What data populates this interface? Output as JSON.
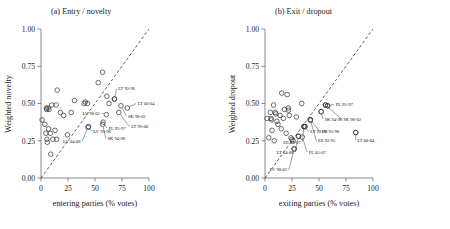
{
  "figure": {
    "width": 450,
    "height": 229,
    "background": "#ffffff",
    "marker_color": "#3c3c3c",
    "line_color": "#2b2b2b"
  },
  "chart_data": [
    {
      "type": "scatter",
      "panel": "a",
      "title": "(a) Entry / novelty",
      "xlabel": "entering parties (% votes)",
      "ylabel": "Weighted novelty",
      "xlim": [
        0,
        100
      ],
      "ylim": [
        0,
        1
      ],
      "xticks": [
        0,
        25,
        50,
        75,
        100
      ],
      "xtick_labels": [
        "0",
        "25",
        "50",
        "75",
        "100"
      ],
      "yticks": [
        0,
        0.25,
        0.5,
        0.75,
        1
      ],
      "ytick_labels": [
        "0.00",
        "0.25",
        "0.50",
        "0.75",
        "1.00"
      ],
      "grid": false,
      "legend": "none",
      "reference_line": {
        "type": "diagonal",
        "style": "dashed",
        "from": [
          0,
          0
        ],
        "to": [
          100,
          1
        ]
      },
      "points": [
        {
          "x": 1.0,
          "y": 0.39
        },
        {
          "x": 3.5,
          "y": 0.36
        },
        {
          "x": 4.5,
          "y": 0.3
        },
        {
          "x": 5.0,
          "y": 0.47
        },
        {
          "x": 5.2,
          "y": 0.46
        },
        {
          "x": 5.5,
          "y": 0.26
        },
        {
          "x": 5.8,
          "y": 0.24
        },
        {
          "x": 6.5,
          "y": 0.47
        },
        {
          "x": 7.0,
          "y": 0.33
        },
        {
          "x": 7.5,
          "y": 0.46
        },
        {
          "x": 8.5,
          "y": 0.3
        },
        {
          "x": 9.0,
          "y": 0.16
        },
        {
          "x": 10.0,
          "y": 0.49
        },
        {
          "x": 11.0,
          "y": 0.26
        },
        {
          "x": 13.0,
          "y": 0.32
        },
        {
          "x": 14.0,
          "y": 0.49
        },
        {
          "x": 14.5,
          "y": 0.26
        },
        {
          "x": 15.0,
          "y": 0.59
        },
        {
          "x": 18.0,
          "y": 0.44
        },
        {
          "x": 21.0,
          "y": 0.42
        },
        {
          "x": 24.5,
          "y": 0.29
        },
        {
          "x": 28.0,
          "y": 0.44
        },
        {
          "x": 31.0,
          "y": 0.52
        },
        {
          "x": 40.0,
          "y": 0.5
        },
        {
          "x": 41.0,
          "y": 0.51
        },
        {
          "x": 43.0,
          "y": 0.5
        },
        {
          "x": 53.0,
          "y": 0.64
        },
        {
          "x": 57.0,
          "y": 0.71
        },
        {
          "x": 61.0,
          "y": 0.55
        },
        {
          "x": 63.0,
          "y": 0.5
        },
        {
          "x": 68.0,
          "y": 0.53
        }
      ],
      "labeled_points": [
        {
          "label": "LT 92-96",
          "x": 68.0,
          "y": 0.53,
          "lx": 70.0,
          "ly": 0.6
        },
        {
          "label": "LT 00-04",
          "x": 80.0,
          "y": 0.47,
          "lx": 88.0,
          "ly": 0.5
        },
        {
          "label": "SK 98-02",
          "x": 74.0,
          "y": 0.485,
          "lx": 79.0,
          "ly": 0.415
        },
        {
          "label": "LV 98-02",
          "x": 60.5,
          "y": 0.425,
          "lx": 56.0,
          "ly": 0.435
        },
        {
          "label": "LT 96-00",
          "x": 72.0,
          "y": 0.44,
          "lx": 82.0,
          "ly": 0.345
        },
        {
          "label": "PL 93-97",
          "x": 57.5,
          "y": 0.375,
          "lx": 61.0,
          "ly": 0.335
        },
        {
          "label": "SK 94-98",
          "x": 57.0,
          "y": 0.36,
          "lx": 60.0,
          "ly": 0.265
        },
        {
          "label": "LV 95-98",
          "x": 44.0,
          "y": 0.345,
          "lx": 47.0,
          "ly": 0.315
        },
        {
          "label": "LV 04-08",
          "x": 43.5,
          "y": 0.34,
          "lx": 38.0,
          "ly": 0.245
        }
      ]
    },
    {
      "type": "scatter",
      "panel": "b",
      "title": "(b) Exit / dropout",
      "xlabel": "exiting parties (% votes)",
      "ylabel": "Weighted dropout",
      "xlim": [
        0,
        100
      ],
      "ylim": [
        0,
        1
      ],
      "xticks": [
        0,
        25,
        50,
        75,
        100
      ],
      "xtick_labels": [
        "0",
        "25",
        "50",
        "75",
        "100"
      ],
      "yticks": [
        0,
        0.25,
        0.5,
        0.75,
        1
      ],
      "ytick_labels": [
        "0.00",
        "0.25",
        "0.50",
        "0.75",
        "1.00"
      ],
      "grid": false,
      "legend": "none",
      "reference_line": {
        "type": "diagonal",
        "style": "dashed",
        "from": [
          0,
          0
        ],
        "to": [
          100,
          1
        ]
      },
      "points": [
        {
          "x": 2.0,
          "y": 0.4
        },
        {
          "x": 3.5,
          "y": 0.27
        },
        {
          "x": 5.0,
          "y": 0.44
        },
        {
          "x": 5.5,
          "y": 0.4
        },
        {
          "x": 6.0,
          "y": 0.39
        },
        {
          "x": 6.5,
          "y": 0.32
        },
        {
          "x": 8.0,
          "y": 0.49
        },
        {
          "x": 8.5,
          "y": 0.25
        },
        {
          "x": 9.5,
          "y": 0.44
        },
        {
          "x": 10.0,
          "y": 0.43
        },
        {
          "x": 11.0,
          "y": 0.38
        },
        {
          "x": 12.0,
          "y": 0.36
        },
        {
          "x": 14.0,
          "y": 0.42
        },
        {
          "x": 15.0,
          "y": 0.33
        },
        {
          "x": 15.5,
          "y": 0.57
        },
        {
          "x": 17.0,
          "y": 0.4
        },
        {
          "x": 18.0,
          "y": 0.46
        },
        {
          "x": 19.5,
          "y": 0.3
        },
        {
          "x": 20.5,
          "y": 0.56
        },
        {
          "x": 21.5,
          "y": 0.47
        },
        {
          "x": 21.8,
          "y": 0.455
        },
        {
          "x": 22.5,
          "y": 0.42
        },
        {
          "x": 24.0,
          "y": 0.27
        },
        {
          "x": 25.0,
          "y": 0.26
        },
        {
          "x": 26.0,
          "y": 0.25
        },
        {
          "x": 27.0,
          "y": 0.195
        },
        {
          "x": 29.0,
          "y": 0.41
        },
        {
          "x": 31.0,
          "y": 0.28
        },
        {
          "x": 34.0,
          "y": 0.5
        },
        {
          "x": 36.0,
          "y": 0.345
        },
        {
          "x": 37.0,
          "y": 0.345
        },
        {
          "x": 42.0,
          "y": 0.39
        },
        {
          "x": 52.0,
          "y": 0.445
        },
        {
          "x": 56.0,
          "y": 0.49
        },
        {
          "x": 58.0,
          "y": 0.485
        },
        {
          "x": 84.0,
          "y": 0.305
        }
      ],
      "labeled_points": [
        {
          "label": "PL 93-97",
          "x": 58.0,
          "y": 0.485,
          "lx": 64.0,
          "ly": 0.495
        },
        {
          "label": "SK 94-98",
          "x": 52.0,
          "y": 0.445,
          "lx": 53.5,
          "ly": 0.395
        },
        {
          "label": "SK 98-02",
          "x": 56.0,
          "y": 0.49,
          "lx": 71.0,
          "ly": 0.395
        },
        {
          "label": "LT 00-04",
          "x": 84.0,
          "y": 0.305,
          "lx": 84.0,
          "ly": 0.255
        },
        {
          "label": "LV 95-98",
          "x": 42.0,
          "y": 0.39,
          "lx": 51.0,
          "ly": 0.31
        },
        {
          "label": "LT 92-96",
          "x": 37.0,
          "y": 0.345,
          "lx": 40.5,
          "ly": 0.31
        },
        {
          "label": "EE 92-95",
          "x": 42.0,
          "y": 0.39,
          "lx": 47.5,
          "ly": 0.25
        },
        {
          "label": "EE 03-07",
          "x": 36.0,
          "y": 0.345,
          "lx": 34.5,
          "ly": 0.24
        },
        {
          "label": "PL 05-07",
          "x": 34.5,
          "y": 0.275,
          "lx": 39.0,
          "ly": 0.175
        },
        {
          "label": "LT 04-08",
          "x": 31.0,
          "y": 0.28,
          "lx": 28.0,
          "ly": 0.175
        },
        {
          "label": "LV 98-02",
          "x": 27.0,
          "y": 0.195,
          "lx": 22.0,
          "ly": 0.055
        }
      ]
    }
  ]
}
